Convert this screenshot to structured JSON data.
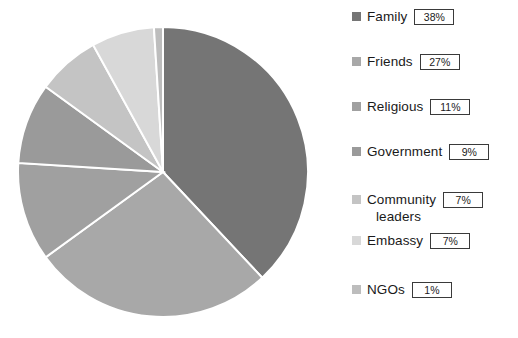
{
  "chart_data": {
    "type": "pie",
    "title": "",
    "categories": [
      "Family",
      "Friends",
      "Religious",
      "Government",
      "Community leaders",
      "Embassy",
      "NGOs"
    ],
    "values": [
      38,
      27,
      11,
      9,
      7,
      7,
      1
    ],
    "value_labels": [
      "38%",
      "27%",
      "11%",
      "9%",
      "7%",
      "7%",
      "1%"
    ],
    "unit": "%",
    "start_angle_deg": 0,
    "direction": "clockwise",
    "legend_position": "right",
    "grid": false,
    "colors": [
      "#757575",
      "#a8a8a8",
      "#a0a0a0",
      "#9a9a9a",
      "#c4c4c4",
      "#d8d8d8",
      "#bdbdbd"
    ],
    "slice_separator_color": "#ffffff"
  },
  "pie": {
    "center_x": 163,
    "center_y": 172,
    "radius": 145,
    "slices": [
      {
        "name": "Family",
        "label": "Family",
        "value": 38,
        "value_label": "38%",
        "color": "#757575"
      },
      {
        "name": "Friends",
        "label": "Friends",
        "value": 27,
        "value_label": "27%",
        "color": "#a8a8a8"
      },
      {
        "name": "Religious",
        "label": "Religious",
        "value": 11,
        "value_label": "11%",
        "color": "#a0a0a0"
      },
      {
        "name": "Government",
        "label": "Government",
        "value": 9,
        "value_label": "9%",
        "color": "#9a9a9a"
      },
      {
        "name": "Community leaders",
        "label": "Community leaders",
        "value": 7,
        "value_label": "7%",
        "color": "#c4c4c4"
      },
      {
        "name": "Embassy",
        "label": "Embassy",
        "value": 7,
        "value_label": "7%",
        "color": "#d8d8d8"
      },
      {
        "name": "NGOs",
        "label": "NGOs",
        "value": 1,
        "value_label": "1%",
        "color": "#bdbdbd"
      }
    ]
  },
  "legend": {
    "items": [
      {
        "label": "Family",
        "label2": "",
        "value": "38%",
        "color": "#757575",
        "top": 8
      },
      {
        "label": "Friends",
        "label2": "",
        "value": "27%",
        "color": "#a8a8a8",
        "top": 53
      },
      {
        "label": "Religious",
        "label2": "",
        "value": "11%",
        "color": "#a0a0a0",
        "top": 98
      },
      {
        "label": "Government",
        "label2": "",
        "value": "9%",
        "color": "#9a9a9a",
        "top": 143
      },
      {
        "label": "Community",
        "label2": "leaders",
        "value": "7%",
        "color": "#c4c4c4",
        "top": 191
      },
      {
        "label": "Embassy",
        "label2": "",
        "value": "7%",
        "color": "#d8d8d8",
        "top": 232
      },
      {
        "label": "NGOs",
        "label2": "",
        "value": "1%",
        "color": "#bdbdbd",
        "top": 281
      }
    ]
  }
}
